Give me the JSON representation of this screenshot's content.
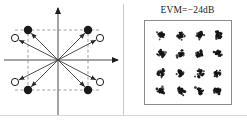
{
  "figure": {
    "type": "two-panel-constellation-figure",
    "background": "#ffffff",
    "ink_color": "#1a1a1a",
    "guide_color": "#8c8c8c"
  },
  "left_panel": {
    "name": "vector-error-diagram",
    "axes": {
      "horizontal_arrow": true,
      "vertical_arrow": true,
      "origin": [
        58,
        60
      ],
      "x_axis_from": [
        4,
        60
      ],
      "x_axis_to": [
        118,
        60
      ],
      "y_axis_from": [
        58,
        116
      ],
      "y_axis_to": [
        58,
        8
      ]
    },
    "dashed_guides": {
      "color": "#8c8c8c",
      "vertical_lines_x": [
        28,
        88
      ],
      "horizontal_lines_y": [
        30,
        90
      ]
    },
    "ideal_points": {
      "marker": "filled-circle",
      "radius": 4.2,
      "fill": "#1a1a1a",
      "points": [
        {
          "label": "ideal-top-left",
          "x": 28,
          "y": 30
        },
        {
          "label": "ideal-top-right",
          "x": 88,
          "y": 30
        },
        {
          "label": "ideal-bottom-left",
          "x": 28,
          "y": 90
        },
        {
          "label": "ideal-bottom-right",
          "x": 88,
          "y": 90
        }
      ]
    },
    "measured_points": {
      "marker": "open-circle",
      "radius": 3.6,
      "stroke": "#1a1a1a",
      "fill": "#ffffff",
      "points": [
        {
          "label": "measured-top-left",
          "x": 15,
          "y": 38
        },
        {
          "label": "measured-top-right",
          "x": 100,
          "y": 38
        },
        {
          "label": "measured-bottom-left",
          "x": 15,
          "y": 82
        },
        {
          "label": "measured-bottom-right",
          "x": 100,
          "y": 82
        }
      ]
    },
    "vectors_from_origin": [
      {
        "label": "vector-to-ideal-top-left",
        "to": [
          28,
          30
        ]
      },
      {
        "label": "vector-to-ideal-top-right",
        "to": [
          88,
          30
        ]
      },
      {
        "label": "vector-to-ideal-bottom-left",
        "to": [
          28,
          90
        ]
      },
      {
        "label": "vector-to-ideal-bottom-right",
        "to": [
          88,
          90
        ]
      },
      {
        "label": "vector-to-measured-top-left",
        "to": [
          15,
          38
        ]
      },
      {
        "label": "vector-to-measured-top-right",
        "to": [
          100,
          38
        ]
      },
      {
        "label": "vector-to-measured-bottom-left",
        "to": [
          15,
          82
        ]
      },
      {
        "label": "vector-to-measured-bottom-right",
        "to": [
          100,
          82
        ]
      }
    ]
  },
  "right_panel": {
    "name": "measured-constellation-panel",
    "title": "EVM=−24dB",
    "evm_value_db": -24,
    "constellation": {
      "order": 16,
      "scheme": "16-QAM",
      "grid_rows": 4,
      "grid_cols": 4,
      "cluster_color": "#141414",
      "cluster_centers": [
        {
          "row": 0,
          "col": 0,
          "x": 16,
          "y": 14
        },
        {
          "row": 0,
          "col": 1,
          "x": 36,
          "y": 14
        },
        {
          "row": 0,
          "col": 2,
          "x": 55,
          "y": 14
        },
        {
          "row": 0,
          "col": 3,
          "x": 73,
          "y": 14
        },
        {
          "row": 1,
          "col": 0,
          "x": 16,
          "y": 33
        },
        {
          "row": 1,
          "col": 1,
          "x": 36,
          "y": 33
        },
        {
          "row": 1,
          "col": 2,
          "x": 55,
          "y": 33
        },
        {
          "row": 1,
          "col": 3,
          "x": 73,
          "y": 33
        },
        {
          "row": 2,
          "col": 0,
          "x": 16,
          "y": 52
        },
        {
          "row": 2,
          "col": 1,
          "x": 36,
          "y": 52
        },
        {
          "row": 2,
          "col": 2,
          "x": 55,
          "y": 52
        },
        {
          "row": 2,
          "col": 3,
          "x": 73,
          "y": 52
        },
        {
          "row": 3,
          "col": 0,
          "x": 16,
          "y": 70
        },
        {
          "row": 3,
          "col": 1,
          "x": 36,
          "y": 70
        },
        {
          "row": 3,
          "col": 2,
          "x": 55,
          "y": 70
        },
        {
          "row": 3,
          "col": 3,
          "x": 73,
          "y": 70
        }
      ],
      "cluster_spread_px": 3.1,
      "points_per_cluster": 26,
      "border_color": "#8b8b8b"
    }
  }
}
